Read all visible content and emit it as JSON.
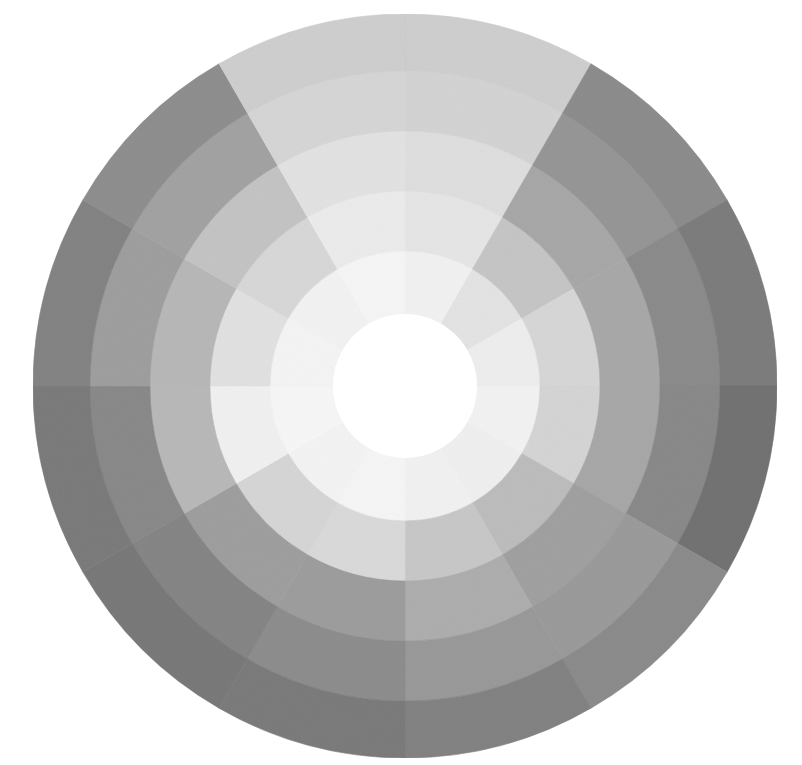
{
  "image": {
    "subject": "grayscale painted color wheel",
    "background": "#ffffff",
    "center": [
      405,
      386
    ],
    "center_disc": {
      "radius": 72,
      "color": "#ffffff"
    },
    "sector_count": 12,
    "start_angle_deg": -90,
    "rings": [
      {
        "r_inner": 72,
        "r_outer": 135,
        "grays": [
          "#f2f2f2",
          "#e4e4e4",
          "#eeeeee",
          "#f3f3f3",
          "#f0f0f0",
          "#f2f2f2",
          "#f6f6f6",
          "#f4f4f4",
          "#f7f7f7",
          "#f5f5f5",
          "#f3f3f3",
          "#f6f6f6"
        ]
      },
      {
        "r_inner": 135,
        "r_outer": 195,
        "grays": [
          "#e6e6e6",
          "#c6c6c6",
          "#d7d7d7",
          "#d5d5d5",
          "#bdbdbd",
          "#c8c8c8",
          "#dadada",
          "#d6d6d6",
          "#f1f1f1",
          "#e2e2e2",
          "#d8d8d8",
          "#ececec"
        ]
      },
      {
        "r_inner": 195,
        "r_outer": 255,
        "grays": [
          "#dfdfdf",
          "#a8a8a8",
          "#a9a9a9",
          "#a8a8a8",
          "#a1a1a1",
          "#aeaeae",
          "#9e9e9e",
          "#9f9f9f",
          "#b9b9b9",
          "#b8b8b8",
          "#c4c4c4",
          "#e3e3e3"
        ]
      },
      {
        "r_inner": 255,
        "r_outer": 315,
        "grays": [
          "#d4d4d4",
          "#979797",
          "#8c8c8c",
          "#8a8a8a",
          "#9b9b9b",
          "#9a9a9a",
          "#8e8e8e",
          "#868686",
          "#8a8a8a",
          "#9f9f9f",
          "#a3a3a3",
          "#d6d6d6"
        ]
      },
      {
        "r_inner": 315,
        "r_outer": 372,
        "grays": [
          "#cfcfcf",
          "#8d8d8d",
          "#7d7d7d",
          "#737373",
          "#8c8c8c",
          "#838383",
          "#7c7c7c",
          "#7a7a7a",
          "#7c7c7c",
          "#848484",
          "#8f8f8f",
          "#cfcfcf"
        ]
      }
    ]
  }
}
